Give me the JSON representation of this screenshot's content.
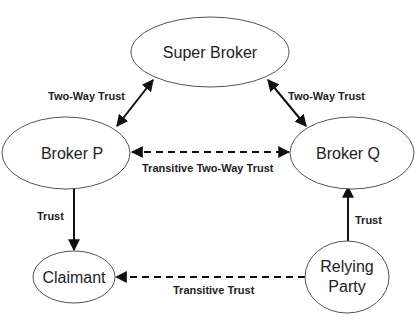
{
  "diagram": {
    "nodes": [
      {
        "id": "super_broker",
        "label": "Super Broker"
      },
      {
        "id": "broker_p",
        "label": "Broker P"
      },
      {
        "id": "broker_q",
        "label": "Broker Q"
      },
      {
        "id": "claimant",
        "label": "Claimant"
      },
      {
        "id": "relying_party",
        "label_line1": "Relying",
        "label_line2": "Party"
      }
    ],
    "edges": [
      {
        "from": "broker_p",
        "to": "super_broker",
        "label": "Two-Way Trust",
        "style": "solid",
        "direction": "both"
      },
      {
        "from": "broker_q",
        "to": "super_broker",
        "label": "Two-Way Trust",
        "style": "solid",
        "direction": "both"
      },
      {
        "from": "broker_p",
        "to": "broker_q",
        "label": "Transitive Two-Way Trust",
        "style": "dashed",
        "direction": "both"
      },
      {
        "from": "broker_p",
        "to": "claimant",
        "label": "Trust",
        "style": "solid",
        "direction": "forward"
      },
      {
        "from": "relying_party",
        "to": "broker_q",
        "label": "Trust",
        "style": "solid",
        "direction": "forward"
      },
      {
        "from": "relying_party",
        "to": "claimant",
        "label": "Transitive Trust",
        "style": "dashed",
        "direction": "forward"
      }
    ]
  }
}
